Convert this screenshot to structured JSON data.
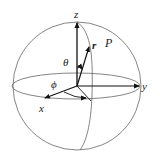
{
  "diagram": {
    "labels": {
      "z": "z",
      "y": "y",
      "x": "x",
      "r": "r",
      "P": "P",
      "theta": "θ",
      "phi": "ϕ"
    },
    "colors": {
      "stroke": "#555555",
      "axis": "#111111",
      "background": "#ffffff"
    }
  }
}
